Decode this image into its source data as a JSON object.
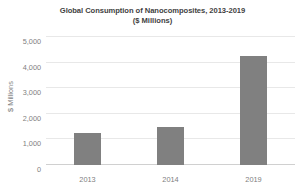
{
  "chart_data": {
    "type": "bar",
    "title": "Global Consumption of Nanocomposites, 2013-2019",
    "subtitle": "($ Millions)",
    "xlabel": "",
    "ylabel": "$ Millions",
    "categories": [
      "2013",
      "2014",
      "2019"
    ],
    "values": [
      1250,
      1480,
      4250
    ],
    "series": [
      {
        "name": "Global Consumption of Nanocomposites",
        "values": [
          1250,
          1480,
          4250
        ]
      }
    ],
    "ylim": [
      0,
      5000
    ],
    "y_ticks": [
      0,
      1000,
      2000,
      3000,
      4000,
      5000
    ],
    "y_tick_labels": [
      "0",
      "1,000",
      "2,000",
      "3,000",
      "4,000",
      "5,000"
    ],
    "grid": true,
    "legend": false,
    "legend_position": "none",
    "bar_color": "#808080",
    "gridline_color": "#e8e8e8",
    "text_color": "#808080",
    "title_color": "#3f3f3f",
    "background_color": "#ffffff"
  }
}
